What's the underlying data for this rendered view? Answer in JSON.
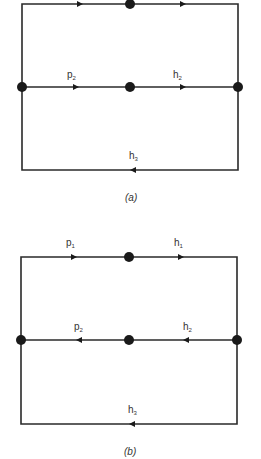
{
  "diagrams": [
    {
      "id": "a",
      "caption": "(a)",
      "edges": [
        {
          "name": "top-left",
          "label": "",
          "direction": "right"
        },
        {
          "name": "top-right",
          "label": "",
          "direction": "right"
        },
        {
          "name": "middle-left",
          "label": "p",
          "subscript": "2",
          "direction": "right"
        },
        {
          "name": "middle-right",
          "label": "h",
          "subscript": "2",
          "direction": "right"
        },
        {
          "name": "bottom",
          "label": "h",
          "subscript": "3",
          "direction": "left"
        }
      ]
    },
    {
      "id": "b",
      "caption": "(b)",
      "edges": [
        {
          "name": "top-left",
          "label": "p",
          "subscript": "1",
          "direction": "right"
        },
        {
          "name": "top-right",
          "label": "h",
          "subscript": "1",
          "direction": "right"
        },
        {
          "name": "middle-left",
          "label": "p",
          "subscript": "2",
          "direction": "left"
        },
        {
          "name": "middle-right",
          "label": "h",
          "subscript": "2",
          "direction": "left"
        },
        {
          "name": "bottom",
          "label": "h",
          "subscript": "3",
          "direction": "left"
        }
      ]
    }
  ]
}
